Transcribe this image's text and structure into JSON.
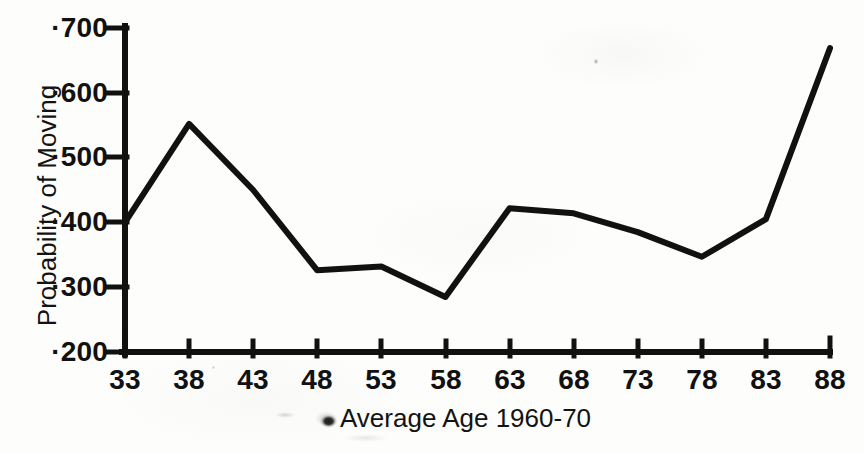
{
  "chart_data": {
    "type": "line",
    "title": "",
    "xlabel": "Average Age 1960-70",
    "ylabel": "Probability of Moving",
    "x": [
      33,
      38,
      43,
      48,
      53,
      58,
      63,
      68,
      73,
      78,
      83,
      88
    ],
    "values": [
      0.4,
      0.552,
      0.45,
      0.326,
      0.332,
      0.285,
      0.422,
      0.414,
      0.385,
      0.347,
      0.405,
      0.669
    ],
    "series": [
      {
        "name": "Probability of Moving",
        "values": [
          0.4,
          0.552,
          0.45,
          0.326,
          0.332,
          0.285,
          0.422,
          0.414,
          0.385,
          0.347,
          0.405,
          0.669
        ]
      }
    ],
    "xlim": [
      33,
      88
    ],
    "ylim": [
      0.2,
      0.7
    ],
    "xtick_labels": [
      "33",
      "38",
      "43",
      "48",
      "53",
      "58",
      "63",
      "68",
      "73",
      "78",
      "83",
      "88"
    ],
    "ytick_labels": [
      "·200",
      "·300",
      "·400",
      "·500",
      "·600",
      "·700"
    ],
    "ytick_values": [
      0.2,
      0.3,
      0.4,
      0.5,
      0.6,
      0.7
    ],
    "grid": false,
    "legend": "none",
    "line_color": "#111111",
    "background_color": "#fdfdfc",
    "axis_color": "#111111"
  },
  "artifacts": {
    "ink_blot_name": "ink-blot-smudge",
    "description": "scanned page ink blot left of x-axis title"
  }
}
